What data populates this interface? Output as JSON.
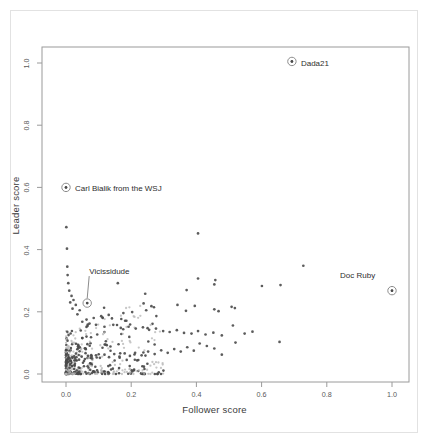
{
  "figure": {
    "background_color": "#ffffff",
    "frame_color": "#9a9a9a",
    "point_color_dark": "#4a4a4a",
    "point_color_light": "#b4b4b4",
    "highlight_ring_color": "#8c8c8c"
  },
  "chart_data": {
    "type": "scatter",
    "title": "",
    "xlabel": "Follower score",
    "ylabel": "Leader score",
    "xlim": [
      -0.03,
      1.05
    ],
    "ylim": [
      -0.03,
      1.04
    ],
    "xticks": [
      "0.0",
      "0.2",
      "0.4",
      "0.6",
      "0.8",
      "1.0"
    ],
    "xtick_values": [
      0.0,
      0.2,
      0.4,
      0.6,
      0.8,
      1.0
    ],
    "yticks": [
      "0.0",
      "0.2",
      "0.4",
      "0.6",
      "0.8",
      "1.0"
    ],
    "ytick_values": [
      0.0,
      0.2,
      0.4,
      0.6,
      0.8,
      1.0
    ],
    "grid": false,
    "legend": null,
    "annotations": [
      {
        "label": "Dada21",
        "x": 0.693,
        "y": 1.005,
        "label_dx": 9,
        "label_dy": 4,
        "leader": false
      },
      {
        "label": "Carl Bialik from the WSJ",
        "x": 0.0,
        "y": 0.6,
        "label_dx": 9,
        "label_dy": 3,
        "leader": false
      },
      {
        "label": "Vicissidude",
        "x": 0.065,
        "y": 0.228,
        "label_dx": 2,
        "label_dy": -30,
        "leader": true
      },
      {
        "label": "Doc Ruby",
        "x": 1.0,
        "y": 0.268,
        "label_dx": -52,
        "label_dy": -14,
        "leader": false
      }
    ],
    "points": [
      [
        0.693,
        1.005
      ],
      [
        0.0,
        0.6
      ],
      [
        0.065,
        0.228
      ],
      [
        1.0,
        0.268
      ],
      [
        0.405,
        0.452
      ],
      [
        0.728,
        0.348
      ],
      [
        0.405,
        0.307
      ],
      [
        0.458,
        0.302
      ],
      [
        0.601,
        0.283
      ],
      [
        0.658,
        0.286
      ],
      [
        0.37,
        0.27
      ],
      [
        0.243,
        0.258
      ],
      [
        0.455,
        0.288
      ],
      [
        0.159,
        0.292
      ],
      [
        0.001,
        0.472
      ],
      [
        0.003,
        0.403
      ],
      [
        0.004,
        0.345
      ],
      [
        0.005,
        0.318
      ],
      [
        0.007,
        0.292
      ],
      [
        0.01,
        0.268
      ],
      [
        0.238,
        0.227
      ],
      [
        0.246,
        0.205
      ],
      [
        0.262,
        0.218
      ],
      [
        0.342,
        0.222
      ],
      [
        0.395,
        0.219
      ],
      [
        0.455,
        0.208
      ],
      [
        0.468,
        0.202
      ],
      [
        0.508,
        0.216
      ],
      [
        0.518,
        0.212
      ],
      [
        0.368,
        0.203
      ],
      [
        0.203,
        0.199
      ],
      [
        0.176,
        0.196
      ],
      [
        0.131,
        0.19
      ],
      [
        0.108,
        0.186
      ],
      [
        0.085,
        0.18
      ],
      [
        0.063,
        0.175
      ],
      [
        0.042,
        0.205
      ],
      [
        0.03,
        0.222
      ],
      [
        0.023,
        0.238
      ],
      [
        0.017,
        0.251
      ],
      [
        0.013,
        0.23
      ],
      [
        0.02,
        0.21
      ],
      [
        0.035,
        0.192
      ],
      [
        0.05,
        0.168
      ],
      [
        0.072,
        0.162
      ],
      [
        0.092,
        0.158
      ],
      [
        0.118,
        0.152
      ],
      [
        0.145,
        0.158
      ],
      [
        0.168,
        0.148
      ],
      [
        0.192,
        0.152
      ],
      [
        0.214,
        0.146
      ],
      [
        0.236,
        0.15
      ],
      [
        0.255,
        0.142
      ],
      [
        0.276,
        0.146
      ],
      [
        0.298,
        0.138
      ],
      [
        0.318,
        0.135
      ],
      [
        0.34,
        0.141
      ],
      [
        0.362,
        0.132
      ],
      [
        0.385,
        0.13
      ],
      [
        0.405,
        0.138
      ],
      [
        0.428,
        0.127
      ],
      [
        0.452,
        0.133
      ],
      [
        0.478,
        0.124
      ],
      [
        0.512,
        0.156
      ],
      [
        0.548,
        0.13
      ],
      [
        0.572,
        0.136
      ],
      [
        0.655,
        0.103
      ],
      [
        0.52,
        0.101
      ],
      [
        0.478,
        0.062
      ],
      [
        0.455,
        0.082
      ],
      [
        0.432,
        0.09
      ],
      [
        0.41,
        0.098
      ],
      [
        0.392,
        0.075
      ],
      [
        0.372,
        0.086
      ],
      [
        0.352,
        0.072
      ],
      [
        0.332,
        0.08
      ],
      [
        0.312,
        0.068
      ],
      [
        0.292,
        0.076
      ],
      [
        0.272,
        0.064
      ],
      [
        0.252,
        0.072
      ],
      [
        0.232,
        0.06
      ],
      [
        0.212,
        0.068
      ],
      [
        0.196,
        0.058
      ],
      [
        0.18,
        0.066
      ],
      [
        0.164,
        0.056
      ],
      [
        0.148,
        0.064
      ],
      [
        0.132,
        0.054
      ],
      [
        0.118,
        0.062
      ],
      [
        0.104,
        0.052
      ],
      [
        0.092,
        0.06
      ],
      [
        0.08,
        0.05
      ],
      [
        0.068,
        0.058
      ],
      [
        0.058,
        0.048
      ],
      [
        0.048,
        0.056
      ],
      [
        0.04,
        0.046
      ],
      [
        0.032,
        0.054
      ],
      [
        0.026,
        0.044
      ],
      [
        0.02,
        0.052
      ],
      [
        0.015,
        0.042
      ],
      [
        0.011,
        0.05
      ],
      [
        0.008,
        0.04
      ],
      [
        0.006,
        0.048
      ],
      [
        0.004,
        0.038
      ],
      [
        0.003,
        0.046
      ],
      [
        0.002,
        0.036
      ],
      [
        0.0015,
        0.044
      ],
      [
        0.001,
        0.034
      ],
      [
        0.0008,
        0.042
      ],
      [
        0.0005,
        0.032
      ],
      [
        0.0003,
        0.04
      ],
      [
        0.0002,
        0.03
      ],
      [
        0.0001,
        0.038
      ]
    ],
    "cluster": {
      "description": "dense mass of light-gray and dark points near the origin",
      "x_range": [
        0.0,
        0.3
      ],
      "y_range": [
        0.0,
        0.22
      ],
      "count": 520
    }
  }
}
